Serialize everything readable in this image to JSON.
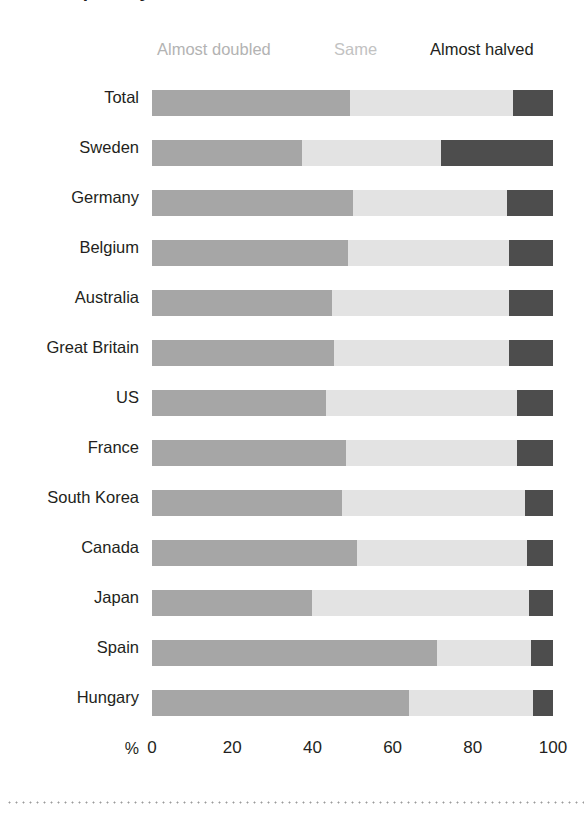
{
  "title": "Extreme poverty has almost halved",
  "legend": {
    "doubled": "Almost doubled",
    "same": "Same",
    "halved": "Almost halved"
  },
  "axis": {
    "unit": "%",
    "ticks": [
      "0",
      "20",
      "40",
      "60",
      "80",
      "100"
    ]
  },
  "colors": {
    "doubled": "#a6a6a6",
    "same": "#e3e3e3",
    "halved": "#4d4d4d",
    "text": "#231f20",
    "legend_muted": "#b3b3b3",
    "background": "#ffffff"
  },
  "rows": [
    {
      "label": "Total"
    },
    {
      "label": "Sweden"
    },
    {
      "label": "Germany"
    },
    {
      "label": "Belgium"
    },
    {
      "label": "Australia"
    },
    {
      "label": "Great Britain"
    },
    {
      "label": "US"
    },
    {
      "label": "France"
    },
    {
      "label": "South Korea"
    },
    {
      "label": "Canada"
    },
    {
      "label": "Japan"
    },
    {
      "label": "Spain"
    },
    {
      "label": "Hungary"
    }
  ],
  "chart_data": {
    "type": "bar",
    "orientation": "horizontal",
    "stacked": true,
    "normalized": true,
    "title": "Extreme poverty has almost halved",
    "xlabel": "%",
    "ylabel": "",
    "xlim": [
      0,
      100
    ],
    "xticks": [
      0,
      20,
      40,
      60,
      80,
      100
    ],
    "grid": false,
    "legend_position": "top",
    "categories": [
      "Total",
      "Sweden",
      "Germany",
      "Belgium",
      "Australia",
      "Great Britain",
      "US",
      "France",
      "South Korea",
      "Canada",
      "Japan",
      "Spain",
      "Hungary"
    ],
    "series": [
      {
        "name": "Almost doubled",
        "color": "#a6a6a6",
        "values": [
          49.5,
          37.5,
          50,
          49,
          45,
          45.5,
          43.5,
          48.5,
          47.5,
          51,
          40,
          71,
          64
        ]
      },
      {
        "name": "Same",
        "color": "#e3e3e3",
        "values": [
          40.5,
          34.5,
          38.5,
          40,
          44,
          43.5,
          47.5,
          42.5,
          45.5,
          42.5,
          54,
          23.5,
          31
        ]
      },
      {
        "name": "Almost halved",
        "color": "#4d4d4d",
        "values": [
          10,
          28,
          11.5,
          11,
          11,
          11,
          9,
          9,
          7,
          6.5,
          6,
          5.5,
          5
        ]
      }
    ]
  }
}
